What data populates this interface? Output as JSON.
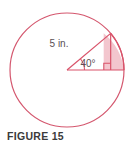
{
  "figure": {
    "caption": "FIGURE 15",
    "labels": {
      "radius": "5 in.",
      "angle": "40°"
    },
    "colors": {
      "stroke": "#d9536a",
      "circle_stroke": "#d4576e",
      "shade_fill": "#f3c6ce",
      "text": "#5a5054",
      "caption_text": "#3b3b3b",
      "background": "#ffffff"
    },
    "geometry": {
      "circle_center_x": 67,
      "circle_center_y": 70,
      "circle_radius": 57,
      "central_angle_degrees": 40,
      "radius_length_value": 5,
      "radius_length_unit": "in.",
      "right_angle_marker": true
    },
    "icon_names": {
      "circle": "circle-outline-icon",
      "sector": "shaded-sector-icon",
      "right_angle": "right-angle-marker-icon"
    }
  }
}
